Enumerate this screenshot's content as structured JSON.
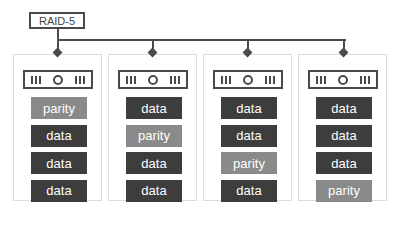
{
  "diagram": {
    "title": "RAID-5",
    "colors": {
      "data": "#3d3d3d",
      "parity": "#8a8a8a",
      "line": "#4a4a4a",
      "border": "#dcdcdc"
    },
    "disks": [
      {
        "icon": "hard-drive-icon",
        "blocks": [
          "parity",
          "data",
          "data",
          "data"
        ]
      },
      {
        "icon": "hard-drive-icon",
        "blocks": [
          "data",
          "parity",
          "data",
          "data"
        ]
      },
      {
        "icon": "hard-drive-icon",
        "blocks": [
          "data",
          "data",
          "parity",
          "data"
        ]
      },
      {
        "icon": "hard-drive-icon",
        "blocks": [
          "data",
          "data",
          "data",
          "parity"
        ]
      }
    ]
  }
}
